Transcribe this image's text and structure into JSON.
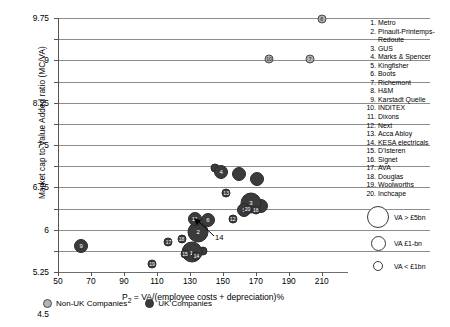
{
  "chart_data": {
    "type": "scatter",
    "title": "",
    "xlabel": "P2 = VA/(employee costs + depreciation)%",
    "ylabel": "Market cap to Value Added ratio (MC/VA)",
    "xlim": [
      50,
      215
    ],
    "ylim": [
      0.75,
      9.75
    ],
    "xticks": [
      50,
      70,
      90,
      110,
      130,
      150,
      170,
      190,
      210
    ],
    "yticks": [
      0.75,
      1.5,
      2.25,
      3,
      3.75,
      4.5,
      5.25,
      6,
      6.75,
      7.5,
      8.25,
      9,
      9.75
    ],
    "grid": true,
    "legend_position": "bottom",
    "bubble_size_meaning": "Value Added (VA)",
    "points": [
      {
        "id": 1,
        "label": "1",
        "name": "Metro",
        "x": 131,
        "y": 1.45,
        "group": "uk",
        "size": "large"
      },
      {
        "id": 2,
        "label": "2",
        "name": "Pinault-Printemps-Redoute",
        "x": 135,
        "y": 2.18,
        "group": "uk",
        "size": "large"
      },
      {
        "id": 3,
        "label": "3",
        "name": "GUS",
        "x": 167,
        "y": 3.2,
        "group": "uk",
        "size": "large"
      },
      {
        "id": 4,
        "label": "4",
        "name": "Marks & Spencer",
        "x": 149,
        "y": 4.3,
        "group": "uk",
        "size": "medium"
      },
      {
        "id": 5,
        "label": "5",
        "name": "Kingfisher",
        "x": 163,
        "y": 2.95,
        "group": "uk",
        "size": "medium"
      },
      {
        "id": 6,
        "label": "6",
        "name": "Boots",
        "x": 141,
        "y": 2.6,
        "group": "uk",
        "size": "medium"
      },
      {
        "id": 7,
        "label": "7",
        "name": "Richemont",
        "x": 203,
        "y": 8.3,
        "group": "nonuk",
        "size": "small"
      },
      {
        "id": 8,
        "label": "8",
        "name": "H&M",
        "x": 210,
        "y": 9.72,
        "group": "nonuk",
        "size": "small"
      },
      {
        "id": 9,
        "label": "9",
        "name": "Karstadt Quelle",
        "x": 64,
        "y": 1.68,
        "group": "uk",
        "size": "medium"
      },
      {
        "id": 10,
        "label": "10",
        "name": "INDITEX",
        "x": 178,
        "y": 8.3,
        "group": "nonuk",
        "size": "small"
      },
      {
        "id": 11,
        "label": "11",
        "name": "Dixons",
        "x": 133,
        "y": 2.62,
        "group": "uk",
        "size": "medium"
      },
      {
        "id": 12,
        "label": "12",
        "name": "Next",
        "x": 156,
        "y": 2.62,
        "group": "uk",
        "size": "small"
      },
      {
        "id": 13,
        "label": "13",
        "name": "Acca Abloy",
        "x": 152,
        "y": 3.55,
        "group": "uk",
        "size": "small"
      },
      {
        "id": 14,
        "label": "14",
        "name": "KESA electricals",
        "x": 134,
        "y": 1.33,
        "group": "uk",
        "size": "small"
      },
      {
        "id": 15,
        "label": "15",
        "name": "D'Isteren",
        "x": 127,
        "y": 1.38,
        "group": "uk",
        "size": "small"
      },
      {
        "id": 16,
        "label": "16",
        "name": "Signet",
        "x": 170,
        "y": 2.95,
        "group": "uk",
        "size": "small"
      },
      {
        "id": 17,
        "label": "17",
        "name": "AVA",
        "x": 117,
        "y": 1.8,
        "group": "uk",
        "size": "small"
      },
      {
        "id": 18,
        "label": "18",
        "name": "Douglas",
        "x": 125,
        "y": 1.92,
        "group": "uk",
        "size": "small"
      },
      {
        "id": 19,
        "label": "19",
        "name": "Woolworths",
        "x": 107,
        "y": 1.05,
        "group": "uk",
        "size": "small"
      },
      {
        "id": 20,
        "label": "20",
        "name": "Inchcape",
        "x": 165,
        "y": 3.0,
        "group": "uk",
        "size": "small"
      }
    ],
    "extra_points": [
      {
        "label": "",
        "x": 145,
        "y": 4.45,
        "group": "uk",
        "size": "small"
      },
      {
        "label": "",
        "x": 160,
        "y": 4.22,
        "group": "uk",
        "size": "medium"
      },
      {
        "label": "",
        "x": 171,
        "y": 4.05,
        "group": "uk",
        "size": "medium"
      },
      {
        "label": "",
        "x": 173,
        "y": 3.1,
        "group": "uk",
        "size": "medium"
      },
      {
        "label": "",
        "x": 138,
        "y": 1.48,
        "group": "uk",
        "size": "small"
      },
      {
        "label": "",
        "x": 128,
        "y": 1.47,
        "group": "uk",
        "size": "small"
      }
    ],
    "callout": {
      "label": "14",
      "target_id": 14
    }
  },
  "axes": {
    "y_title_main": "Market cap to Value Added ratio (MC/VA)",
    "x_title_prefix": "P",
    "x_title_sub": "2",
    "x_title_rest": " = VA/(employee costs + depreciation)%",
    "y_tick_labels": [
      "9.75",
      "9",
      "8.25",
      "7.5",
      "6.75",
      "6",
      "5.25",
      "4.5",
      "3.75",
      "3",
      "2.25",
      "1.5",
      "0.75"
    ],
    "x_tick_labels": [
      "50",
      "70",
      "90",
      "110",
      "130",
      "150",
      "170",
      "190",
      "210"
    ]
  },
  "company_list": {
    "items": [
      {
        "num": "1.",
        "name": "Metro"
      },
      {
        "num": "2.",
        "name": "Pinault-Printemps-",
        "cont": "Redoute"
      },
      {
        "num": "3.",
        "name": "GUS"
      },
      {
        "num": "4.",
        "name": "Marks & Spencer"
      },
      {
        "num": "5.",
        "name": "Kingfisher"
      },
      {
        "num": "6.",
        "name": "Boots"
      },
      {
        "num": "7.",
        "name": "Richemont"
      },
      {
        "num": "8.",
        "name": "H&M"
      },
      {
        "num": "9.",
        "name": "Karstadt Quelle"
      },
      {
        "num": "10.",
        "name": "INDITEX"
      },
      {
        "num": "11.",
        "name": "Dixons"
      },
      {
        "num": "12.",
        "name": "Next"
      },
      {
        "num": "13.",
        "name": "Acca Abloy"
      },
      {
        "num": "14.",
        "name": "KESA electricals"
      },
      {
        "num": "15.",
        "name": "D'Isteren"
      },
      {
        "num": "16.",
        "name": "Signet"
      },
      {
        "num": "17.",
        "name": "AVA"
      },
      {
        "num": "18.",
        "name": "Douglas"
      },
      {
        "num": "19.",
        "name": "Woolworths"
      },
      {
        "num": "20.",
        "name": "Inchcape"
      }
    ]
  },
  "size_legend": {
    "rows": [
      {
        "text": "VA > £5bn",
        "diameter": 22
      },
      {
        "text": "VA  £1-bn",
        "diameter": 15
      },
      {
        "text": "VA < £1bn",
        "diameter": 10
      }
    ]
  },
  "bottom_legend": {
    "items": [
      {
        "label": "Non-UK Companies",
        "group": "nonuk",
        "color": "#b3b3b3"
      },
      {
        "label": "UK Companies",
        "group": "uk",
        "color": "#3b3b3b"
      }
    ]
  }
}
